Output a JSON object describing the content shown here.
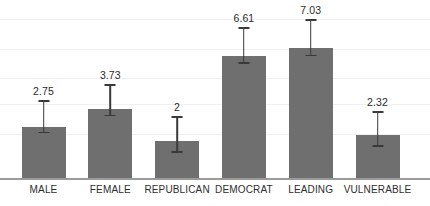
{
  "chart_data": {
    "type": "bar",
    "title": "",
    "xlabel": "",
    "ylabel": "",
    "categories": [
      "MALE",
      "FEMALE",
      "REPUBLICAN",
      "DEMOCRAT",
      "LEADING",
      "VULNERABLE"
    ],
    "values": [
      2.75,
      3.73,
      2,
      6.61,
      7.03,
      2.32
    ],
    "value_labels": [
      "2.75",
      "3.73",
      "2",
      "6.61",
      "7.03",
      "2.32"
    ],
    "error_bars": {
      "present": true,
      "upper": [
        1.45,
        1.35,
        1.35,
        1.55,
        1.55,
        1.3
      ],
      "lower": [
        0.25,
        0.3,
        0.55,
        0.35,
        0.35,
        0.55
      ]
    },
    "ylim": [
      0,
      9.2
    ],
    "grid": true,
    "gridline_values": [
      8.6,
      7.0,
      5.4,
      4.0,
      2.4
    ],
    "legend": null,
    "legend_position": "none",
    "bar_color": "#6f6f6f",
    "error_color": "#3a3a3a",
    "axis_color": "#9a9a9a",
    "grid_color": "#f0f0f0",
    "label_color": "#2e2e2e"
  }
}
